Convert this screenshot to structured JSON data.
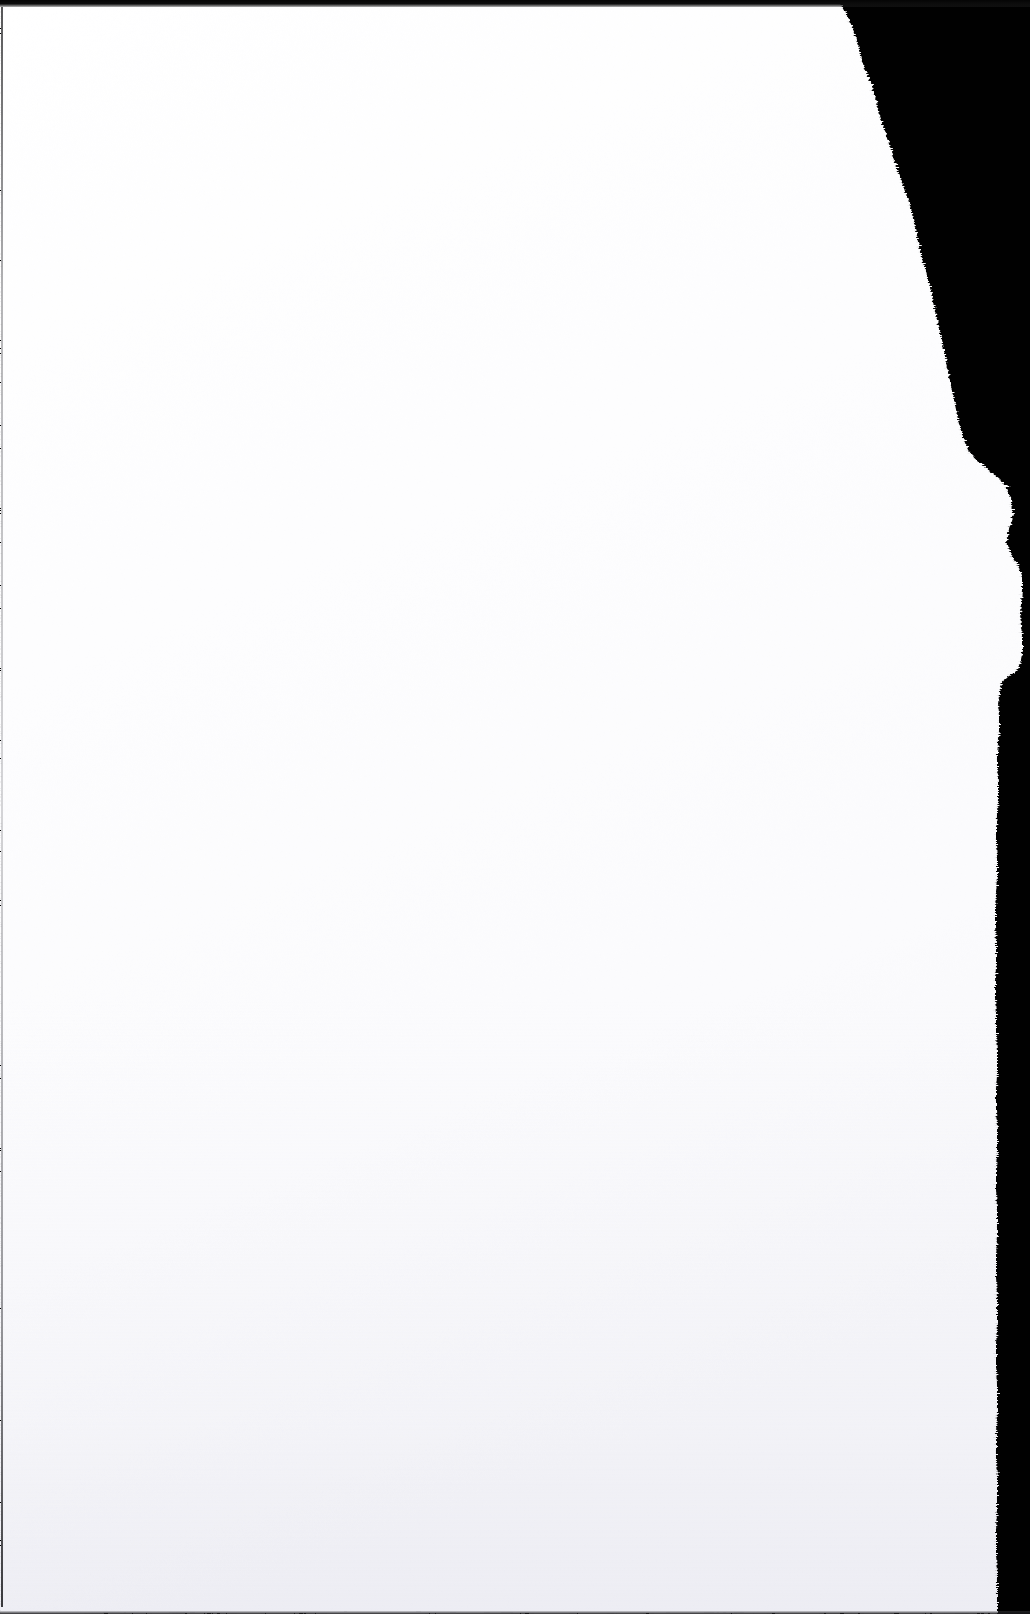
{
  "document": {
    "kind": "scanned-page",
    "title": "Blank scanned page with torn right edge",
    "page_content_text": "",
    "visible_text_present": "none",
    "orientation": "portrait",
    "width_px": 1030,
    "height_px": 1614
  },
  "colors": {
    "paper_white": "#fdfdfd",
    "paper_highlight": "#ffffff",
    "paper_shadow": "#f2f2f5",
    "scanner_black": "#010101",
    "edge_line_gray": "#5a5a5f",
    "top_band_dark": "#0a0a0a"
  },
  "regions": {
    "paper": {
      "name": "paper-sheet",
      "description": "Blank white sheet occupying the left and center of the scan",
      "surface": "uncoated white paper with faint grain"
    },
    "backdrop": {
      "name": "scanner-backdrop",
      "description": "Solid black scanner lid visible to the right of the torn edge"
    },
    "torn_edge": {
      "name": "torn-right-edge",
      "description": "Ragged hand-torn boundary running top to bottom along the right side",
      "profile_note": "Starts near x=838 at the top, slopes right, bulges to about x=1022 near y=560-670, then settles to a near-vertical line at about x=997"
    }
  },
  "artifacts": {
    "top_band": "dark scanner band across the top edge",
    "left_rule": "thin gray scanner line along the left edge",
    "bottom_rule": "thin dark line along the bottom edge"
  },
  "tear_outline_points": [
    [
      838,
      0
    ],
    [
      846,
      14
    ],
    [
      853,
      30
    ],
    [
      858,
      46
    ],
    [
      861,
      60
    ],
    [
      866,
      74
    ],
    [
      872,
      88
    ],
    [
      876,
      102
    ],
    [
      879,
      116
    ],
    [
      884,
      130
    ],
    [
      889,
      144
    ],
    [
      893,
      158
    ],
    [
      898,
      172
    ],
    [
      903,
      186
    ],
    [
      908,
      200
    ],
    [
      912,
      214
    ],
    [
      915,
      228
    ],
    [
      918,
      242
    ],
    [
      921,
      256
    ],
    [
      925,
      270
    ],
    [
      929,
      284
    ],
    [
      932,
      298
    ],
    [
      935,
      312
    ],
    [
      938,
      326
    ],
    [
      941,
      340
    ],
    [
      944,
      354
    ],
    [
      947,
      368
    ],
    [
      950,
      382
    ],
    [
      953,
      396
    ],
    [
      956,
      410
    ],
    [
      959,
      424
    ],
    [
      963,
      438
    ],
    [
      968,
      450
    ],
    [
      976,
      460
    ],
    [
      985,
      468
    ],
    [
      993,
      474
    ],
    [
      1000,
      480
    ],
    [
      1006,
      488
    ],
    [
      1010,
      498
    ],
    [
      1012,
      510
    ],
    [
      1011,
      522
    ],
    [
      1008,
      532
    ],
    [
      1006,
      542
    ],
    [
      1009,
      552
    ],
    [
      1014,
      560
    ],
    [
      1019,
      568
    ],
    [
      1022,
      578
    ],
    [
      1022,
      590
    ],
    [
      1021,
      602
    ],
    [
      1020,
      614
    ],
    [
      1021,
      626
    ],
    [
      1022,
      638
    ],
    [
      1022,
      650
    ],
    [
      1021,
      660
    ],
    [
      1018,
      668
    ],
    [
      1012,
      674
    ],
    [
      1006,
      678
    ],
    [
      1001,
      682
    ],
    [
      999,
      692
    ],
    [
      998,
      704
    ],
    [
      999,
      716
    ],
    [
      999,
      728
    ],
    [
      998,
      740
    ],
    [
      997,
      754
    ],
    [
      997,
      768
    ],
    [
      998,
      782
    ],
    [
      998,
      796
    ],
    [
      997,
      812
    ],
    [
      996,
      828
    ],
    [
      996,
      844
    ],
    [
      997,
      860
    ],
    [
      997,
      876
    ],
    [
      996,
      892
    ],
    [
      995,
      908
    ],
    [
      995,
      926
    ],
    [
      996,
      944
    ],
    [
      996,
      962
    ],
    [
      995,
      980
    ],
    [
      995,
      998
    ],
    [
      996,
      1016
    ],
    [
      996,
      1034
    ],
    [
      997,
      1052
    ],
    [
      997,
      1070
    ],
    [
      996,
      1090
    ],
    [
      996,
      1110
    ],
    [
      997,
      1130
    ],
    [
      997,
      1150
    ],
    [
      996,
      1170
    ],
    [
      996,
      1190
    ],
    [
      997,
      1212
    ],
    [
      997,
      1234
    ],
    [
      996,
      1256
    ],
    [
      996,
      1278
    ],
    [
      997,
      1300
    ],
    [
      997,
      1322
    ],
    [
      996,
      1344
    ],
    [
      996,
      1366
    ],
    [
      997,
      1388
    ],
    [
      997,
      1410
    ],
    [
      996,
      1434
    ],
    [
      996,
      1458
    ],
    [
      997,
      1482
    ],
    [
      997,
      1506
    ],
    [
      996,
      1530
    ],
    [
      996,
      1554
    ],
    [
      997,
      1578
    ],
    [
      997,
      1600
    ],
    [
      997,
      1614
    ]
  ]
}
